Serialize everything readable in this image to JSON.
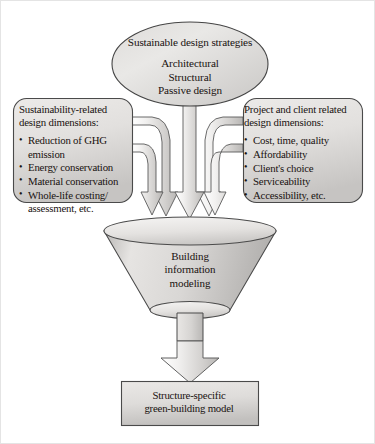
{
  "diagram": {
    "source_ellipse": {
      "heading": "Sustainable design strategies",
      "lines": [
        "Architectural",
        "Structural",
        "Passive design"
      ]
    },
    "left_box": {
      "heading_line1": "Sustainability-related",
      "heading_line2": "design dimensions:",
      "bullets": [
        "Reduction of GHG emission",
        "Energy conservation",
        "Material conservation",
        "Whole-life costing/ assessment, etc."
      ]
    },
    "right_box": {
      "heading_line1": "Project and client related",
      "heading_line2": "design dimensions:",
      "bullets": [
        "Cost, time, quality",
        "Affordability",
        "Client's choice",
        "Serviceability",
        "Accessibility, etc."
      ]
    },
    "funnel": {
      "lines": [
        "Building",
        "information",
        "modeling"
      ]
    },
    "output_box": {
      "lines": [
        "Structure-specific",
        "green-building model"
      ]
    },
    "colors": {
      "shape_fill_light": "#f2f1f0",
      "shape_fill_mid": "#cfcdcb",
      "shape_fill_dark": "#b4b1af",
      "stroke": "#4a4a4a",
      "text": "#191210",
      "background": "#ffffff"
    }
  }
}
